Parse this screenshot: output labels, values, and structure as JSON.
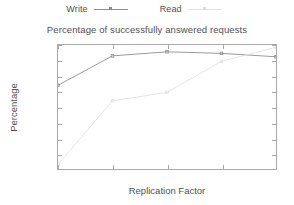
{
  "legend": {
    "position": "top-center",
    "entries": [
      {
        "label": "Write",
        "color": "#8d8d8d",
        "sample": "line-with-point"
      },
      {
        "label": "Read",
        "color": "#e0e0e0",
        "sample": "line-with-point"
      }
    ]
  },
  "chart_data": {
    "type": "line",
    "title": "Percentage of successfully answered requests",
    "xlabel": "Replication Factor",
    "ylabel": "Percentage",
    "x": [
      3,
      5,
      7,
      9,
      11
    ],
    "xticks": [
      "3",
      "5",
      "7",
      "9",
      "11"
    ],
    "yticks": [
      "60",
      "65",
      "70",
      "75",
      "80",
      "85",
      "90",
      "95",
      "100"
    ],
    "xlim": [
      3,
      11
    ],
    "ylim": [
      60,
      100
    ],
    "grid": false,
    "series": [
      {
        "name": "Write",
        "color": "#8d8d8d",
        "values": [
          87.0,
          96.5,
          97.8,
          97.3,
          96.2
        ]
      },
      {
        "name": "Read",
        "color": "#e0e0e0",
        "values": [
          61.5,
          82.0,
          84.7,
          94.7,
          99.3
        ]
      }
    ]
  },
  "colors": {
    "frame": "#a9a9a9",
    "text": "#4f4f4f",
    "background": "#ffffff"
  }
}
